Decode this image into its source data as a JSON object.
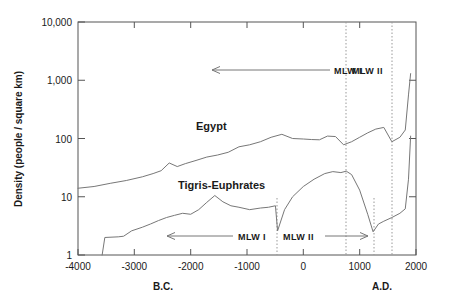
{
  "chart_data": {
    "type": "line",
    "title": "",
    "xlabel_left": "B.C.",
    "xlabel_right": "A.D.",
    "ylabel": "Density (people / square km)",
    "yscale": "log",
    "ylim": [
      1,
      10000
    ],
    "xlim": [
      -4200,
      2100
    ],
    "grid": false,
    "legend": "inline-labels",
    "yticks": [
      1,
      10,
      100,
      1000,
      10000
    ],
    "ytick_labels": [
      "1",
      "10",
      "100",
      "1,000",
      "10,000"
    ],
    "xticks": [
      -4000,
      -3000,
      -2000,
      -1000,
      0,
      1000,
      2000
    ],
    "xtick_labels": [
      "-4000",
      "-3000",
      "-2000",
      "-1000",
      "0",
      "1000",
      "2000"
    ],
    "series": [
      {
        "name": "Egypt",
        "label": "Egypt",
        "x": [
          -4200,
          -3900,
          -3600,
          -3300,
          -3000,
          -2800,
          -2650,
          -2500,
          -2350,
          -2200,
          -2000,
          -1800,
          -1600,
          -1400,
          -1200,
          -1000,
          -800,
          -600,
          -400,
          -200,
          0,
          150,
          300,
          450,
          600,
          750,
          900,
          1050,
          1200,
          1350,
          1500,
          1650,
          1800,
          1900,
          1960,
          2000
        ],
        "y": [
          14,
          15,
          17,
          19,
          22,
          25,
          28,
          38,
          33,
          37,
          42,
          48,
          52,
          58,
          72,
          78,
          88,
          105,
          118,
          100,
          98,
          96,
          95,
          110,
          108,
          78,
          88,
          105,
          125,
          145,
          155,
          88,
          105,
          140,
          560,
          1300
        ]
      },
      {
        "name": "Tigris-Euphrates",
        "label": "Tigris-Euphrates",
        "x": [
          -3750,
          -3700,
          -3450,
          -3350,
          -3200,
          -3000,
          -2850,
          -2700,
          -2550,
          -2400,
          -2250,
          -2100,
          -1950,
          -1800,
          -1650,
          -1500,
          -1350,
          -1200,
          -1000,
          -800,
          -650,
          -520,
          -480,
          -350,
          -200,
          0,
          200,
          400,
          550,
          700,
          800,
          900,
          1050,
          1200,
          1300,
          1400,
          1500,
          1650,
          1800,
          1900,
          1960,
          2000
        ],
        "y": [
          1.0,
          2.0,
          2.05,
          2.1,
          2.6,
          3.0,
          3.4,
          3.9,
          4.4,
          4.8,
          5.2,
          5.0,
          6.0,
          8.0,
          10.5,
          8.2,
          7.0,
          6.6,
          6.0,
          6.4,
          6.6,
          7.0,
          2.6,
          6.0,
          10.0,
          15.0,
          20.0,
          25.0,
          27.0,
          26.0,
          27.5,
          24.0,
          13.0,
          5.0,
          2.5,
          3.4,
          3.8,
          4.4,
          5.2,
          6.2,
          20.0,
          110.0
        ]
      }
    ],
    "annotations": [
      {
        "name": "mlw1-upper",
        "label": "MLW I",
        "label_x": 310,
        "label_y": 72,
        "arrow_from_x": 330,
        "arrow_to_x": 212,
        "arrow_y": 70,
        "direction": "left"
      },
      {
        "name": "mlw2-upper",
        "label": "MLW II",
        "label_x": 352,
        "label_y": 72,
        "arrow": false
      },
      {
        "name": "mlw1-lower",
        "label": "MLW I",
        "label_x": 240,
        "label_y": 239,
        "arrow_from_x": 233,
        "arrow_to_x": 167,
        "arrow_y": 236,
        "direction": "left"
      },
      {
        "name": "mlw2-lower",
        "label": "MLW II",
        "label_x": 288,
        "label_y": 239,
        "arrow_from_x": 325,
        "arrow_to_x": 368,
        "arrow_y": 236,
        "direction": "right"
      }
    ],
    "vlines": [
      {
        "name": "vline-mlw2-upper-start",
        "x_px": 346,
        "y_top": 22,
        "y_bottom": 255
      },
      {
        "name": "vline-mlw2-upper-end",
        "x_px": 392,
        "y_top": 22,
        "y_bottom": 255
      },
      {
        "name": "vline-mlw1-lower-end",
        "x_px": 277,
        "y_top": 200,
        "y_bottom": 255
      },
      {
        "name": "vline-mlw2-lower-end",
        "x_px": 374,
        "y_top": 200,
        "y_bottom": 255
      }
    ],
    "series_labels": [
      {
        "name": "egypt-label",
        "text": "Egypt",
        "x_px": 196,
        "y_px": 130
      },
      {
        "name": "tigris-label",
        "text": "Tigris-Euphrates",
        "x_px": 178,
        "y_px": 189
      }
    ]
  }
}
